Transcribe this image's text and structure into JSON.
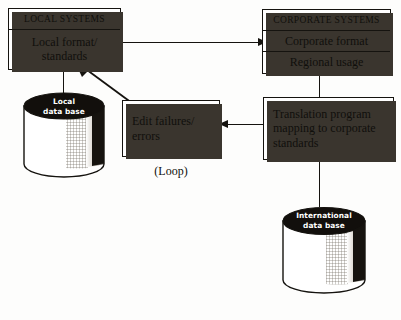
{
  "diagram": {
    "colors": {
      "ink": "#15130f",
      "paper": "#fdfdfc",
      "shadow": "#3a352e",
      "cylinder_dark": "#120f0c"
    },
    "boxes": {
      "local_systems": {
        "header": "LOCAL SYSTEMS",
        "rows": [
          "Local format/ standards"
        ]
      },
      "corporate_systems": {
        "header": "CORPORATE SYSTEMS",
        "rows": [
          "Corporate format",
          "Regional usage"
        ]
      },
      "translation": {
        "text": "Translation program mapping to corporate standards"
      },
      "edit_failures": {
        "text": "Edit failures/ errors"
      }
    },
    "databases": {
      "local": {
        "line1": "Local",
        "line2": "data base"
      },
      "international": {
        "line1": "International",
        "line2": "data base"
      }
    },
    "captions": {
      "loop": "(Loop)"
    }
  }
}
